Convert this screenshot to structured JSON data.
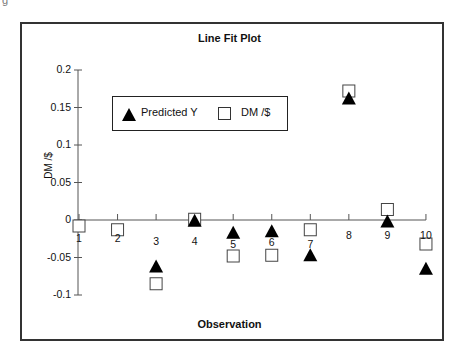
{
  "chart_data": {
    "type": "scatter",
    "title": "Line Fit Plot",
    "xlabel": "Observation",
    "ylabel": "DM /$",
    "ylim": [
      -0.1,
      0.2
    ],
    "yticks": [
      "0.2",
      "0.15",
      "0.1",
      "0.05",
      "0",
      "-0.05",
      "-0.1"
    ],
    "x": [
      1,
      2,
      3,
      4,
      5,
      6,
      7,
      8,
      9,
      10
    ],
    "xticks": [
      "1",
      "2",
      "3",
      "4",
      "5",
      "6",
      "7",
      "8",
      "9",
      "10"
    ],
    "series": [
      {
        "name": "Predicted Y",
        "marker": "filled-triangle",
        "values": [
          null,
          null,
          -0.062,
          -0.001,
          -0.017,
          -0.015,
          -0.047,
          0.162,
          -0.002,
          -0.065
        ]
      },
      {
        "name": "DM /$",
        "marker": "hollow-square",
        "values": [
          -0.008,
          -0.013,
          -0.085,
          0.001,
          -0.048,
          -0.047,
          -0.013,
          0.172,
          0.014,
          -0.032
        ]
      }
    ],
    "legend": {
      "position": "upper-left-inside",
      "entries": [
        "Predicted Y",
        "DM /$"
      ]
    },
    "grid": false
  },
  "legend": {
    "item1": "Predicted Y",
    "item2": "DM /$"
  }
}
